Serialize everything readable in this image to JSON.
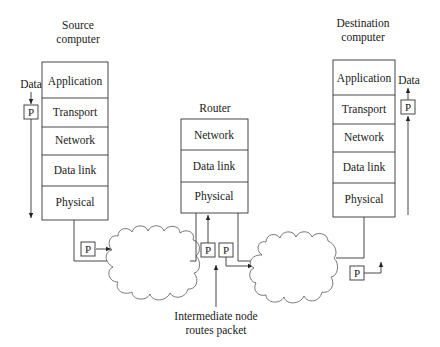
{
  "diagram": {
    "source": {
      "title_line1": "Source",
      "title_line2": "computer",
      "layers": [
        "Application",
        "Transport",
        "Network",
        "Data link",
        "Physical"
      ],
      "data_label": "Data",
      "packet_label": "P"
    },
    "router": {
      "title": "Router",
      "layers": [
        "Network",
        "Data link",
        "Physical"
      ],
      "packet_in_label": "P",
      "packet_out_label": "P"
    },
    "destination": {
      "title_line1": "Destination",
      "title_line2": "computer",
      "layers": [
        "Application",
        "Transport",
        "Network",
        "Data link",
        "Physical"
      ],
      "data_label": "Data",
      "packet_label": "P"
    },
    "network1": {
      "packet_label": "P"
    },
    "network2": {
      "packet_label": "P"
    },
    "annotation": {
      "line1": "Intermediate node",
      "line2": "routes packet"
    }
  }
}
